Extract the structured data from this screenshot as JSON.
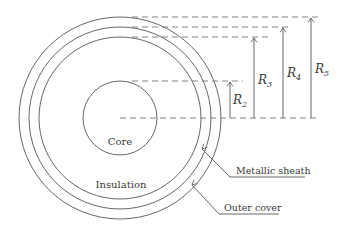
{
  "diagram": {
    "type": "cable cross-section",
    "labels": {
      "core": "Core",
      "insulation": "Insulation",
      "metallic_sheath": "Metallic sheath",
      "outer_cover": "Outer cover"
    },
    "radii": [
      {
        "name": "R",
        "sub": "2",
        "label": "R2"
      },
      {
        "name": "R",
        "sub": "3",
        "label": "R3"
      },
      {
        "name": "R",
        "sub": "4",
        "label": "R4"
      },
      {
        "name": "R",
        "sub": "5",
        "label": "R5"
      }
    ],
    "colors": {
      "line": "#555555",
      "dash": "#777777",
      "text": "#3a3a3a"
    }
  }
}
